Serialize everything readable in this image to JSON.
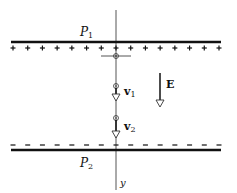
{
  "diagram": {
    "type": "physics-schematic",
    "plate_top": {
      "label": "P",
      "subscript": "1",
      "charge_sign": "+",
      "charge_count": 15
    },
    "plate_bottom": {
      "label": "P",
      "subscript": "2",
      "charge_sign": "−",
      "charge_count": 15
    },
    "field": {
      "label": "E",
      "direction": "down"
    },
    "particle_velocities": [
      {
        "label": "v",
        "subscript": "1",
        "direction": "down"
      },
      {
        "label": "v",
        "subscript": "2",
        "direction": "down"
      }
    ],
    "axis": {
      "label": "y",
      "direction": "down"
    },
    "colors": {
      "ink": "#111111",
      "axis": "#555555",
      "background": "#ffffff"
    }
  }
}
